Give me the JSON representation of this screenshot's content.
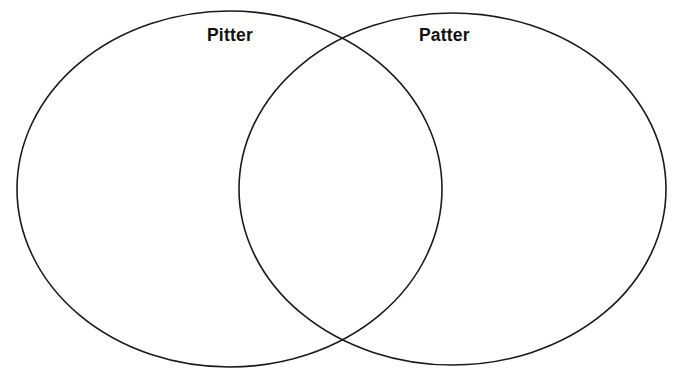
{
  "diagram": {
    "type": "venn-2-set",
    "title": "",
    "canvas": {
      "width": 684,
      "height": 382,
      "background": "#ffffff"
    },
    "stroke": {
      "color": "#1a1a1a",
      "width": 1.6
    },
    "sets": [
      {
        "id": "left",
        "label": "Pitter",
        "label_x": 231,
        "label_y": 36,
        "ellipse": {
          "cx": 229.5,
          "cy": 189,
          "rx": 212.5,
          "ry": 178
        },
        "fill": "none"
      },
      {
        "id": "right",
        "label": "Patter",
        "label_x": 445,
        "label_y": 36,
        "ellipse": {
          "cx": 452.5,
          "cy": 189,
          "rx": 213.5,
          "ry": 176
        },
        "fill": "none"
      }
    ],
    "overlap": {
      "label": "",
      "crossing_points": [
        {
          "x": 341,
          "y": 37
        },
        {
          "x": 341,
          "y": 340
        }
      ],
      "left_bound_x": 239,
      "right_bound_x": 442
    },
    "regions": {
      "left_only_text": "",
      "intersection_text": "",
      "right_only_text": ""
    }
  }
}
